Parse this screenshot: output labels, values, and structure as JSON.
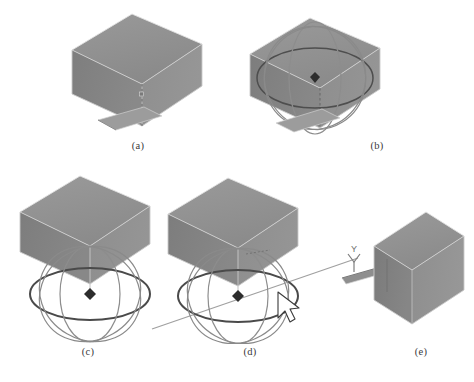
{
  "figure": {
    "type": "multi-panel-figure",
    "panel_count": 5,
    "background_color": "#ffffff"
  },
  "palette": {
    "face_top": "#8e8e8e",
    "face_left": "#828282",
    "face_right": "#909090",
    "edge_light": "#d8d8d8",
    "edge_dark": "#5e5e5e",
    "ring_dark": "#4a4a4a",
    "ring_light": "#b6b6b6",
    "axis_line": "#9a9a9a",
    "center_marker": "#2d2d2d",
    "cursor_fill": "#ffffff",
    "cursor_stroke": "#3a3a3a",
    "caption_color": "#3a3a3a"
  },
  "panels": [
    {
      "id": "a",
      "caption": "(a)",
      "title": "box-only",
      "has_box": true,
      "has_trackball": false,
      "has_axis_line": false,
      "has_cursor": false,
      "has_center_marker": false,
      "has_y_axis_widget": false,
      "has_handle_bar": true
    },
    {
      "id": "b",
      "caption": "(b)",
      "title": "box-with-trackball-gizmo",
      "has_box": true,
      "has_trackball": true,
      "has_axis_line": false,
      "has_cursor": false,
      "has_center_marker": true,
      "has_y_axis_widget": false,
      "has_handle_bar": true
    },
    {
      "id": "c",
      "caption": "(c)",
      "title": "trackball-dropped-below-box",
      "has_box": true,
      "has_trackball": true,
      "has_axis_line": false,
      "has_cursor": false,
      "has_center_marker": true,
      "has_y_axis_widget": false,
      "has_handle_bar": false
    },
    {
      "id": "d",
      "caption": "(d)",
      "title": "rotation-axis-selected-with-cursor",
      "has_box": true,
      "has_trackball": true,
      "has_axis_line": true,
      "has_cursor": true,
      "has_center_marker": true,
      "has_y_axis_widget": false,
      "has_handle_bar": false
    },
    {
      "id": "e",
      "caption": "(e)",
      "title": "rotated-box-with-y-axis-widget",
      "has_box": true,
      "has_trackball": false,
      "has_axis_line": false,
      "has_cursor": false,
      "has_center_marker": false,
      "has_y_axis_widget": true,
      "has_handle_bar": true
    }
  ],
  "widgets": {
    "y_axis_label": "Y",
    "trackball_ring_count": 4,
    "cursor_icon": "arrow-pointer-icon",
    "center_icon": "pivot-point-icon"
  }
}
